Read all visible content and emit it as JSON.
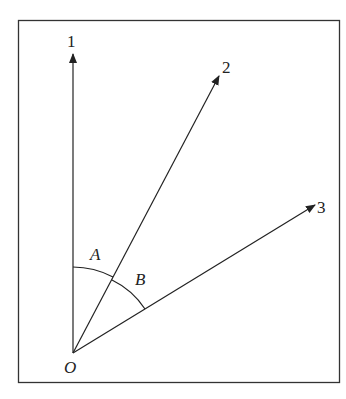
{
  "diagram": {
    "origin": {
      "label": "O",
      "x": 73,
      "y": 353
    },
    "rays": [
      {
        "id": "1",
        "label": "1",
        "end": {
          "x": 73,
          "y": 53
        },
        "label_pos": {
          "x": 67,
          "y": 47
        }
      },
      {
        "id": "2",
        "label": "2",
        "end": {
          "x": 220,
          "y": 75
        },
        "label_pos": {
          "x": 222,
          "y": 72
        }
      },
      {
        "id": "3",
        "label": "3",
        "end": {
          "x": 316,
          "y": 204
        },
        "label_pos": {
          "x": 317,
          "y": 212
        }
      }
    ],
    "angles": [
      {
        "label": "A",
        "between": [
          "1",
          "2"
        ]
      },
      {
        "label": "B",
        "between": [
          "2",
          "3"
        ]
      }
    ],
    "colors": {
      "line": "#222222",
      "border": "#333333",
      "background": "#ffffff"
    }
  }
}
